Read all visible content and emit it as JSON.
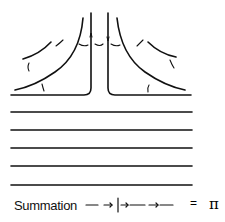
{
  "diagram": {
    "type": "flow-schematic",
    "stroke_color": "#111111",
    "background_color": "#ffffff",
    "horizontal_lines_count": 6,
    "vertical_walls_count": 2,
    "curved_streamlines": {
      "left": 2,
      "right": 2
    },
    "arrow_markers": "small curved arrows indicating flow direction"
  },
  "legend": {
    "label": "Summation",
    "equals": "=",
    "result_symbol": "π",
    "arrow_sequence": [
      "—",
      "→|",
      "→—",
      "→—"
    ]
  }
}
